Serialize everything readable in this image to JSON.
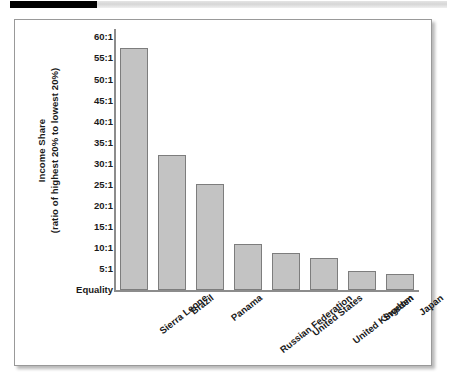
{
  "decor": {
    "rule_black_name": "black-rule",
    "rule_gray_name": "gray-rule"
  },
  "chart_data": {
    "type": "bar",
    "title": "",
    "subtitle": "",
    "xlabel": "",
    "ylabel_line1": "Income Share",
    "ylabel_line2": "(ratio of highest 20% to lowest 20%)",
    "categories": [
      "Sierra Leone",
      "Brazil",
      "Panama",
      "Russian Federation",
      "United States",
      "United Kingdom",
      "Sweden",
      "Japan"
    ],
    "values": [
      57.6,
      32.1,
      25.2,
      11.0,
      8.9,
      7.5,
      4.6,
      3.9
    ],
    "value_labels": [
      "57.6:1",
      "32.1:1",
      "25.2:1",
      "11.0:1",
      "8.9:1",
      "7.5:1",
      "4.6:1",
      "3.9:1"
    ],
    "ylim": [
      0,
      62
    ],
    "ytick_values": [
      60,
      55,
      50,
      45,
      40,
      35,
      30,
      25,
      20,
      15,
      10,
      5,
      0
    ],
    "ytick_labels": [
      "60:1",
      "55:1",
      "50:1",
      "45:1",
      "40:1",
      "35:1",
      "30:1",
      "25:1",
      "20:1",
      "15:1",
      "10:1",
      "5:1",
      "Equality"
    ],
    "grid": false,
    "legend": null,
    "legend_position": "none",
    "bar_fill_color": "#c3c3c3",
    "bar_border_color": "#7d7d7d",
    "axis_color": "#8c8c8c",
    "text_color": "#1a1a1a"
  }
}
